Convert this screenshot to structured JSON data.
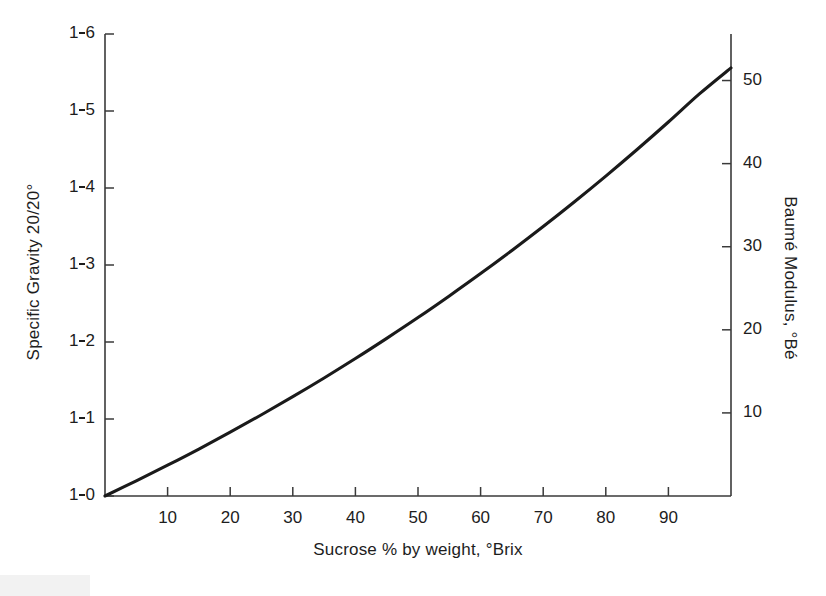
{
  "figure": {
    "kind": "line-plot",
    "background_color": "#ffffff",
    "line_color": "#1a1a1a",
    "axis_color": "#3a3a3a"
  },
  "chart_data": {
    "type": "line",
    "title": "",
    "subtitle": "",
    "xlabel": "Sucrose % by weight, °Brix",
    "ylabel": "Specific Gravity 20/20°",
    "ylabel_right": "Baumé Modulus, °Bé",
    "grid": false,
    "legend": false,
    "legend_position": "none",
    "xlim": [
      0,
      100
    ],
    "ylim": [
      1.0,
      1.6
    ],
    "ylim_right": [
      0,
      55.6
    ],
    "xticks": [
      10,
      20,
      30,
      40,
      50,
      60,
      70,
      80,
      90
    ],
    "xticklabels": [
      "10",
      "20",
      "30",
      "40",
      "50",
      "60",
      "70",
      "80",
      "90"
    ],
    "yticks": [
      1.0,
      1.1,
      1.2,
      1.3,
      1.4,
      1.5,
      1.6
    ],
    "yticklabels": [
      "1·0",
      "1·1",
      "1·2",
      "1·3",
      "1·4",
      "1·5",
      "1·6"
    ],
    "yticks_right": [
      10,
      20,
      30,
      40,
      50
    ],
    "yticklabels_right": [
      "10",
      "20",
      "30",
      "40",
      "50"
    ],
    "series": [
      {
        "name": "Specific gravity vs sucrose concentration",
        "x": [
          0,
          5,
          10,
          15,
          20,
          25,
          30,
          35,
          40,
          45,
          50,
          55,
          60,
          65,
          70,
          75,
          80,
          85,
          90,
          95,
          100
        ],
        "values": [
          1.0,
          1.0197,
          1.04,
          1.061,
          1.0829,
          1.1055,
          1.129,
          1.1533,
          1.1785,
          1.2047,
          1.2317,
          1.2598,
          1.2888,
          1.3189,
          1.35,
          1.3822,
          1.4155,
          1.45,
          1.4857,
          1.5225,
          1.556
        ],
        "values_baume": [
          0.0,
          2.8,
          5.6,
          8.4,
          11.2,
          14.0,
          16.8,
          19.5,
          22.3,
          25.0,
          27.8,
          30.5,
          33.2,
          35.9,
          38.6,
          41.3,
          43.9,
          46.6,
          49.2,
          51.0,
          52.3
        ]
      }
    ]
  },
  "left_axis": {
    "title": "Specific Gravity 20/20°",
    "ticks": [
      {
        "label_int": "1",
        "label_dec": "6",
        "value": 1.6
      },
      {
        "label_int": "1",
        "label_dec": "5",
        "value": 1.5
      },
      {
        "label_int": "1",
        "label_dec": "4",
        "value": 1.4
      },
      {
        "label_int": "1",
        "label_dec": "3",
        "value": 1.3
      },
      {
        "label_int": "1",
        "label_dec": "2",
        "value": 1.2
      },
      {
        "label_int": "1",
        "label_dec": "1",
        "value": 1.1
      },
      {
        "label_int": "1",
        "label_dec": "0",
        "value": 1.0
      }
    ]
  },
  "right_axis": {
    "title": "Baumé Modulus, °Bé",
    "ticks": [
      {
        "label": "50",
        "value": 50
      },
      {
        "label": "40",
        "value": 40
      },
      {
        "label": "30",
        "value": 30
      },
      {
        "label": "20",
        "value": 20
      },
      {
        "label": "10",
        "value": 10
      }
    ]
  },
  "bottom_axis": {
    "title": "Sucrose % by weight, °Brix",
    "ticks": [
      {
        "label": "10",
        "value": 10
      },
      {
        "label": "20",
        "value": 20
      },
      {
        "label": "30",
        "value": 30
      },
      {
        "label": "40",
        "value": 40
      },
      {
        "label": "50",
        "value": 50
      },
      {
        "label": "60",
        "value": 60
      },
      {
        "label": "70",
        "value": 70
      },
      {
        "label": "80",
        "value": 80
      },
      {
        "label": "90",
        "value": 90
      }
    ]
  }
}
